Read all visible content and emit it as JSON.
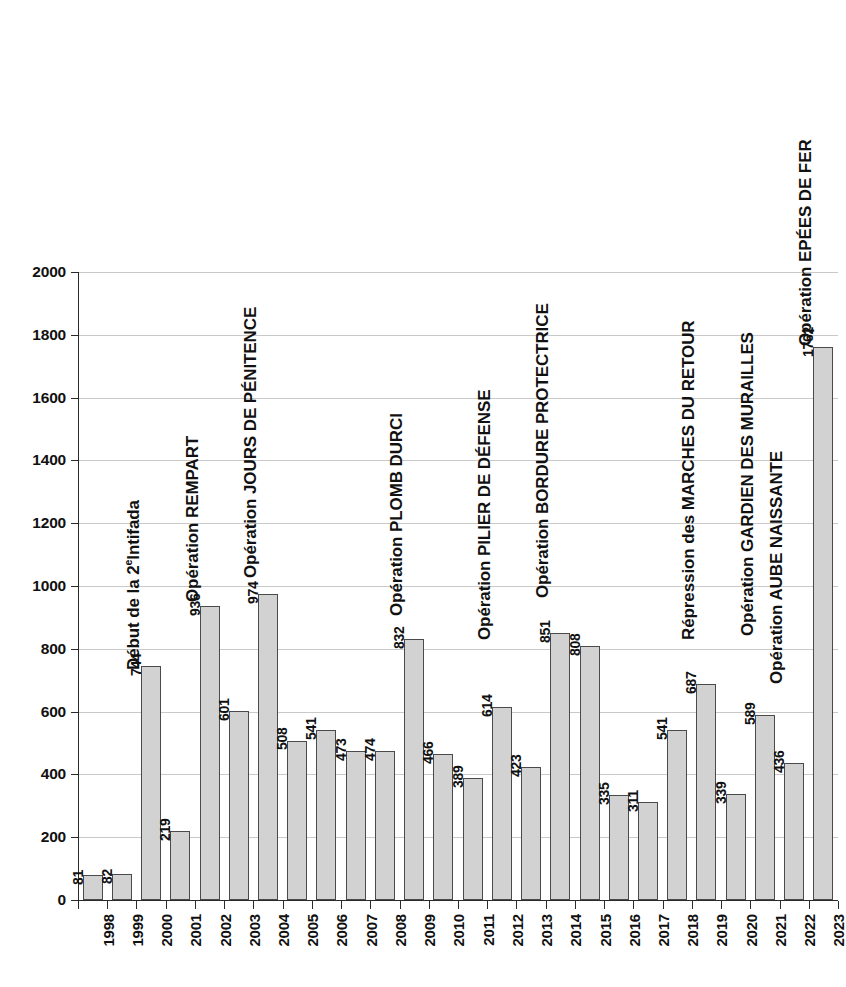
{
  "chart_data": {
    "type": "bar",
    "title": "",
    "xlabel": "",
    "ylabel": "",
    "ylim": [
      0,
      2000
    ],
    "y_ticks": [
      0,
      200,
      400,
      600,
      800,
      1000,
      1200,
      1400,
      1600,
      1800,
      2000
    ],
    "grid": true,
    "legend": "none",
    "bar_color": "#d2d2d2",
    "bar_border_color": "#4a4a4a",
    "categories": [
      "1998",
      "1999",
      "2000",
      "2001",
      "2002",
      "2003",
      "2004",
      "2005",
      "2006",
      "2007",
      "2008",
      "2009",
      "2010",
      "2011",
      "2012",
      "2013",
      "2014",
      "2015",
      "2016",
      "2017",
      "2018",
      "2019",
      "2020",
      "2021",
      "2022",
      "2023"
    ],
    "values": [
      81,
      82,
      744,
      219,
      936,
      601,
      974,
      508,
      541,
      473,
      474,
      832,
      466,
      389,
      614,
      423,
      851,
      808,
      335,
      311,
      541,
      687,
      339,
      589,
      436,
      1762
    ],
    "annotations": [
      {
        "category": "2000",
        "text": "Début de la 2",
        "sup": "e",
        "text_tail": "Intifada"
      },
      {
        "category": "2002",
        "text": "Opération REMPART",
        "sup": "",
        "text_tail": ""
      },
      {
        "category": "2004",
        "text": "Opération JOURS DE PÉNITENCE",
        "sup": "",
        "text_tail": ""
      },
      {
        "category": "2009",
        "text": "Opération PLOMB DURCI",
        "sup": "",
        "text_tail": ""
      },
      {
        "category": "2012",
        "text": "Opération PILIER DE DÉFENSE",
        "sup": "",
        "text_tail": ""
      },
      {
        "category": "2014",
        "text": "Opération BORDURE PROTECTRICE",
        "sup": "",
        "text_tail": ""
      },
      {
        "category": "2019",
        "text": "Répression des MARCHES DU RETOUR",
        "sup": "",
        "text_tail": ""
      },
      {
        "category": "2021",
        "text": "Opération GARDIEN DES MURAILLES",
        "sup": "",
        "text_tail": ""
      },
      {
        "category": "2022",
        "text": "Opération AUBE NAISSANTE",
        "sup": "",
        "text_tail": ""
      },
      {
        "category": "2023",
        "text": "Opération EPÉES DE FER",
        "sup": "",
        "text_tail": ""
      }
    ]
  }
}
